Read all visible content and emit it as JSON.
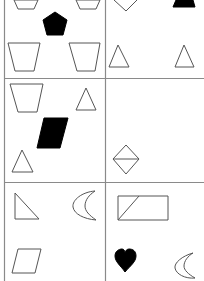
{
  "colors": {
    "background": "#ffffff",
    "grid_line": "#8a8a8a",
    "shape_stroke": "#555555",
    "shape_fill": "#000000"
  },
  "grid": {
    "columns": 2,
    "rows": 3,
    "left_border_x": 4,
    "vertical_divider_x": 105,
    "row_dividers_y": [
      78,
      182
    ]
  },
  "cells": [
    {
      "id": "r1c1",
      "shapes": [
        "outline trapezoid (top, partially cropped)",
        "outline trapezoid (top, partially cropped)",
        "filled pentagon",
        "outline trapezoid",
        "outline trapezoid"
      ]
    },
    {
      "id": "r1c2",
      "shapes": [
        "outline inverted triangle/diamond (partially cropped)",
        "filled triangle (partially cropped)",
        "outline triangle",
        "outline triangle"
      ]
    },
    {
      "id": "r2c1",
      "shapes": [
        "outline trapezoid",
        "outline triangle",
        "filled parallelogram",
        "outline triangle"
      ]
    },
    {
      "id": "r2c2",
      "shapes": [
        "outline diamond with horizontal line"
      ]
    },
    {
      "id": "r3c1",
      "shapes": [
        "outline right triangle",
        "outline crescent moon",
        "outline parallelogram"
      ]
    },
    {
      "id": "r3c2",
      "shapes": [
        "outline rectangle with diagonal line",
        "filled heart",
        "outline crescent moon"
      ]
    }
  ]
}
